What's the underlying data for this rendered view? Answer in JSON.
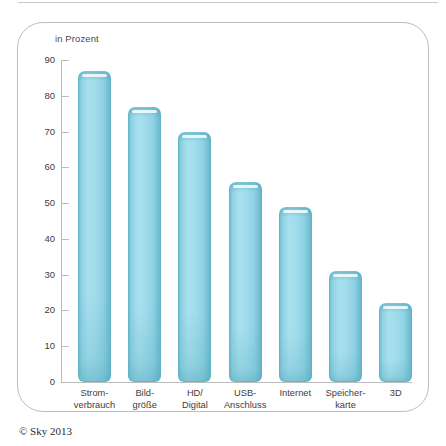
{
  "figure": {
    "unit_label": "in Prozent",
    "copyright": "© Sky 2013"
  },
  "chart_data": {
    "type": "bar",
    "title": "",
    "subtitle": "",
    "xlabel": "",
    "ylabel": "in Prozent",
    "ylim": [
      0,
      90
    ],
    "ytick_labels": [
      "90",
      "80",
      "70",
      "60",
      "50",
      "40",
      "30",
      "20",
      "10",
      "0"
    ],
    "yticks": [
      90,
      80,
      70,
      60,
      50,
      40,
      30,
      20,
      10,
      0
    ],
    "grid": false,
    "legend": "none",
    "categories": [
      "Strom-\nverbrauch",
      "Bild-\ngröße",
      "HD/\nDigital",
      "USB-\nAnschluss",
      "Internet",
      "Speicher-\nkarte",
      "3D"
    ],
    "category_lines": [
      [
        "Strom-",
        "verbrauch"
      ],
      [
        "Bild-",
        "größe"
      ],
      [
        "HD/",
        "Digital"
      ],
      [
        "USB-",
        "Anschluss"
      ],
      [
        "Internet",
        ""
      ],
      [
        "Speicher-",
        "karte"
      ],
      [
        "3D",
        ""
      ]
    ],
    "values": [
      87,
      77,
      70,
      56,
      49,
      31,
      22
    ],
    "bar_color": "#9fdcec",
    "bar_edge_color": "#5cafc1"
  }
}
